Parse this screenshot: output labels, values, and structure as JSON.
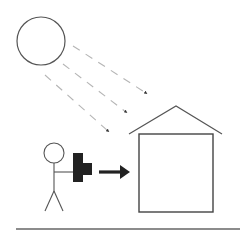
{
  "scene": {
    "description": "Person holding a camera pointed at a house, with sunlight rays shining on the house",
    "width": 242,
    "height": 233,
    "colors": {
      "stroke": "#555555",
      "dark_stroke": "#333333",
      "ray": "#b5b5b5",
      "camera": "#222222",
      "arrow": "#222222",
      "ground": "#666666",
      "background": "#ffffff"
    }
  },
  "elements": {
    "sun": {
      "icon": "sun-circle",
      "cx": 41,
      "cy": 41,
      "r": 24
    },
    "rays": [
      {
        "x1": 73,
        "y1": 46,
        "x2": 147,
        "y2": 94
      },
      {
        "x1": 63,
        "y1": 64,
        "x2": 127,
        "y2": 113
      },
      {
        "x1": 45,
        "y1": 75,
        "x2": 109,
        "y2": 132
      }
    ],
    "house": {
      "roof": {
        "left": [
          129,
          134
        ],
        "apex": [
          176,
          106
        ],
        "right": [
          222,
          134
        ]
      },
      "body": {
        "x": 139,
        "y": 134,
        "width": 74,
        "height": 78
      }
    },
    "person": {
      "icon": "stick-figure",
      "head": {
        "cx": 54,
        "cy": 153,
        "r": 10
      }
    },
    "camera": {
      "icon": "camera-icon"
    },
    "arrow": {
      "icon": "arrow-right-icon"
    },
    "ground": {
      "x1": 16,
      "y1": 229,
      "x2": 240,
      "y2": 229
    }
  }
}
